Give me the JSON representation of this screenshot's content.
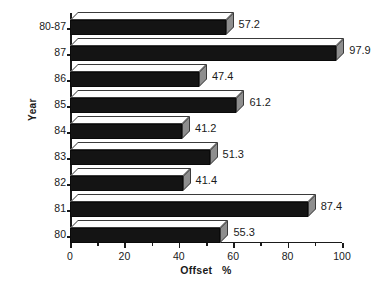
{
  "chart_data": {
    "type": "bar",
    "orientation": "horizontal",
    "title": "",
    "xlabel": "Offset   %",
    "ylabel": "Year",
    "categories": [
      "80",
      "81",
      "82",
      "83",
      "84",
      "85",
      "86",
      "87",
      "80-87"
    ],
    "values": [
      55.3,
      87.4,
      41.4,
      51.3,
      41.2,
      61.2,
      47.4,
      97.9,
      57.2
    ],
    "data_labels": [
      "55.3",
      "87.4",
      "41.4",
      "51.3",
      "41.2",
      "61.2",
      "47.4",
      "97.9",
      "57.2"
    ],
    "xlim": [
      0,
      100
    ],
    "xticks": [
      0,
      20,
      40,
      60,
      80,
      100
    ],
    "xtick_labels": [
      "0",
      "20",
      "40",
      "60",
      "80",
      "100"
    ],
    "xticks_minor": [
      10,
      30,
      50,
      70,
      90
    ],
    "grid": false,
    "legend": false,
    "style": {
      "bar_front_color": "#141414",
      "bar_top_color": "#fefefe",
      "bar_side_color": "#8e8e8e",
      "axis_color": "#1a1a1a",
      "background": "#ffffff"
    }
  }
}
